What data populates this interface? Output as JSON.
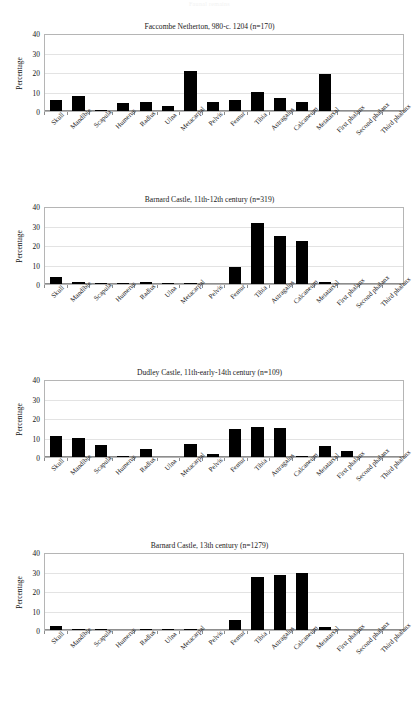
{
  "page": {
    "header_text": "Faunal remains"
  },
  "axis": {
    "y_label": "Percentage",
    "y_ticks": [
      "40",
      "30",
      "20",
      "10",
      "0"
    ],
    "categories": [
      "Skull",
      "Mandible",
      "Scapula",
      "Humerus",
      "Radius",
      "Ulna",
      "Metacarpal",
      "Pelvis",
      "Femur",
      "Tibia",
      "Astragalus",
      "Calcaneum",
      "Metatarsal",
      "First phalanx",
      "Second phalanx",
      "Third phalanx"
    ]
  },
  "chart_data": [
    {
      "type": "bar",
      "title": "Faccombe Netherton, 980-c. 1204 (n=170)",
      "xlabel": "",
      "ylabel": "Percentage",
      "ylim": [
        0,
        40
      ],
      "yticks": [
        0,
        10,
        20,
        30,
        40
      ],
      "grid": true,
      "legend": "none",
      "bar_color": "#000000",
      "categories": [
        "Skull",
        "Mandible",
        "Scapula",
        "Humerus",
        "Radius",
        "Ulna",
        "Metacarpal",
        "Pelvis",
        "Femur",
        "Tibia",
        "Astragalus",
        "Calcaneum",
        "Metatarsal",
        "First phalanx",
        "Second phalanx",
        "Third phalanx"
      ],
      "values": [
        6.0,
        8.0,
        0.4,
        4.0,
        4.7,
        2.7,
        21.0,
        4.6,
        5.8,
        10.2,
        7.0,
        5.0,
        19.3,
        0,
        0,
        0
      ]
    },
    {
      "type": "bar",
      "title": "Barnard Castle, 11th-12th century (n=319)",
      "xlabel": "",
      "ylabel": "Percentage",
      "ylim": [
        0,
        40
      ],
      "yticks": [
        0,
        10,
        20,
        30,
        40
      ],
      "grid": true,
      "legend": "none",
      "bar_color": "#000000",
      "categories": [
        "Skull",
        "Mandible",
        "Scapula",
        "Humerus",
        "Radius",
        "Ulna",
        "Metacarpal",
        "Pelvis",
        "Femur",
        "Tibia",
        "Astragalus",
        "Calcaneum",
        "Metatarsal",
        "First phalanx",
        "Second phalanx",
        "Third phalanx"
      ],
      "values": [
        3.8,
        1.0,
        0.5,
        0.7,
        1.0,
        0.6,
        0.6,
        0,
        8.7,
        32.0,
        25.2,
        22.8,
        1.0,
        0,
        0,
        0
      ]
    },
    {
      "type": "bar",
      "title": "Dudley Castle, 11th-early-14th century (n=109)",
      "xlabel": "",
      "ylabel": "Percentage",
      "ylim": [
        0,
        40
      ],
      "yticks": [
        0,
        10,
        20,
        30,
        40
      ],
      "grid": true,
      "legend": "none",
      "bar_color": "#000000",
      "categories": [
        "Skull",
        "Mandible",
        "Scapula",
        "Humerus",
        "Radius",
        "Ulna",
        "Metacarpal",
        "Pelvis",
        "Femur",
        "Tibia",
        "Astragalus",
        "Calcaneum",
        "Metatarsal",
        "First phalanx",
        "Second phalanx",
        "Third phalanx"
      ],
      "values": [
        11.0,
        10.0,
        6.2,
        0.7,
        4.0,
        0,
        7.0,
        1.6,
        14.5,
        16.0,
        15.2,
        0.5,
        5.8,
        3.0,
        0,
        0
      ]
    },
    {
      "type": "bar",
      "title": "Barnard Castle, 13th century (n=1279)",
      "xlabel": "",
      "ylabel": "Percentage",
      "ylim": [
        0,
        40
      ],
      "yticks": [
        0,
        10,
        20,
        30,
        40
      ],
      "grid": true,
      "legend": "none",
      "bar_color": "#000000",
      "categories": [
        "Skull",
        "Mandible",
        "Scapula",
        "Humerus",
        "Radius",
        "Ulna",
        "Metacarpal",
        "Pelvis",
        "Femur",
        "Tibia",
        "Astragalus",
        "Calcaneum",
        "Metatarsal",
        "First phalanx",
        "Second phalanx",
        "Third phalanx"
      ],
      "values": [
        1.9,
        0.4,
        0.4,
        0,
        0.3,
        0.3,
        0.4,
        0,
        5.4,
        28.0,
        29.0,
        29.8,
        1.7,
        0,
        0,
        0
      ]
    }
  ]
}
